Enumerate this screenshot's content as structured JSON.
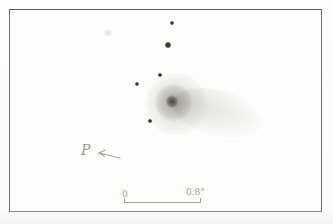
{
  "figure": {
    "kind": "comet-sketch",
    "annotations": {
      "direction_label": "P",
      "scale_label_left": "0",
      "scale_label_right": "0.8°"
    },
    "stars": [
      {
        "x": 172,
        "y": 23,
        "r": 2.1
      },
      {
        "x": 168,
        "y": 45,
        "r": 2.6
      },
      {
        "x": 160,
        "y": 75,
        "r": 1.8
      },
      {
        "x": 137,
        "y": 84,
        "r": 2.0
      },
      {
        "x": 150,
        "y": 121,
        "r": 1.8
      }
    ],
    "comet": {
      "coma_center_x": 176,
      "coma_center_y": 104,
      "nucleus_x": 172,
      "nucleus_y": 101,
      "tail_direction_deg": 15,
      "tail_extent_x": 252
    },
    "colors": {
      "paper": "#fdfdfb",
      "frame": "#6e6e6c",
      "star_ink": "#35322e",
      "pencil_light": "#a6a399",
      "coma_shade": "#a09c93"
    }
  }
}
